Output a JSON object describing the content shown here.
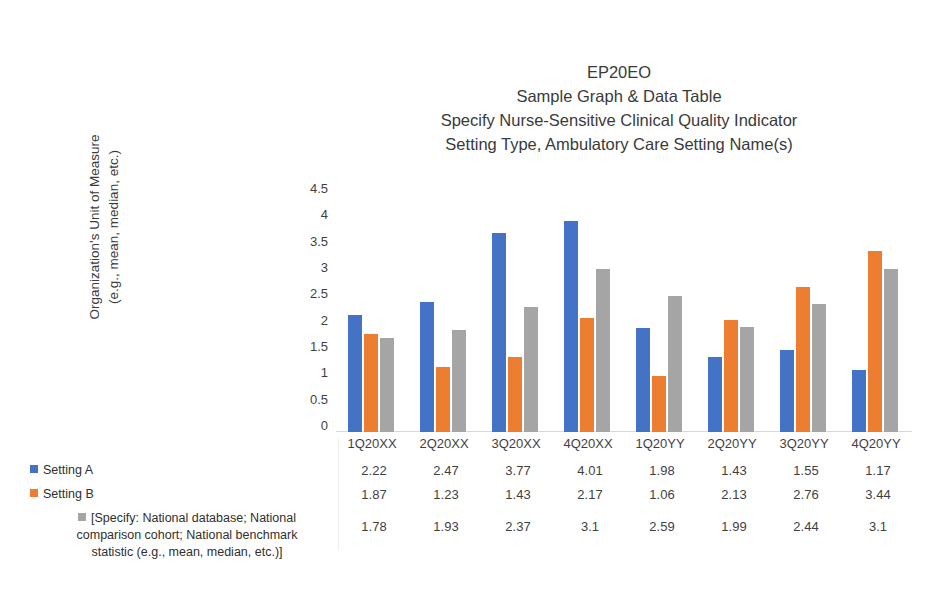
{
  "chart_data": {
    "type": "bar",
    "title": "EP20EO\nSample Graph & Data Table\nSpecify Nurse-Sensitive Clinical Quality Indicator\nSetting Type, Ambulatory Care Setting Name(s)",
    "title_lines": [
      "EP20EO",
      "Sample Graph & Data Table",
      "Specify Nurse-Sensitive Clinical Quality Indicator",
      "Setting Type, Ambulatory Care Setting Name(s)"
    ],
    "xlabel": "",
    "ylabel": "Organization's Unit of Measure (e.g., mean, median, etc.)",
    "ylabel_lines": [
      "Organization's Unit of Measure",
      "(e.g., mean, median, etc.)"
    ],
    "categories": [
      "1Q20XX",
      "2Q20XX",
      "3Q20XX",
      "4Q20XX",
      "1Q20YY",
      "2Q20YY",
      "3Q20YY",
      "4Q20YY"
    ],
    "series": [
      {
        "name": "Setting A",
        "color": "#4472C4",
        "values": [
          2.22,
          2.47,
          3.77,
          4.01,
          1.98,
          1.43,
          1.55,
          1.17
        ]
      },
      {
        "name": "Setting B",
        "color": "#ED7D31",
        "values": [
          1.87,
          1.23,
          1.43,
          2.17,
          1.06,
          2.13,
          2.76,
          3.44
        ]
      },
      {
        "name": "[Specify: National database; National comparison cohort; National benchmark statistic (e.g., mean, median, etc.)]",
        "name_lines": [
          "[Specify: National database; National",
          "comparison cohort; National benchmark",
          "statistic (e.g., mean, median, etc.)]"
        ],
        "color": "#A5A5A5",
        "values": [
          1.78,
          1.93,
          2.37,
          3.1,
          2.59,
          1.99,
          2.44,
          3.1
        ]
      }
    ],
    "ylim": [
      0,
      4.5
    ],
    "yticks": [
      0,
      0.5,
      1,
      1.5,
      2,
      2.5,
      3,
      3.5,
      4,
      4.5
    ],
    "ytick_labels": [
      "0",
      "0.5",
      "1",
      "1.5",
      "2",
      "2.5",
      "3",
      "3.5",
      "4",
      "4.5"
    ],
    "grid": false,
    "legend_position": "left-below-plot",
    "table_values": [
      [
        "2.22",
        "2.47",
        "3.77",
        "4.01",
        "1.98",
        "1.43",
        "1.55",
        "1.17"
      ],
      [
        "1.87",
        "1.23",
        "1.43",
        "2.17",
        "1.06",
        "2.13",
        "2.76",
        "3.44"
      ],
      [
        "1.78",
        "1.93",
        "2.37",
        "3.1",
        "2.59",
        "1.99",
        "2.44",
        "3.1"
      ]
    ]
  }
}
